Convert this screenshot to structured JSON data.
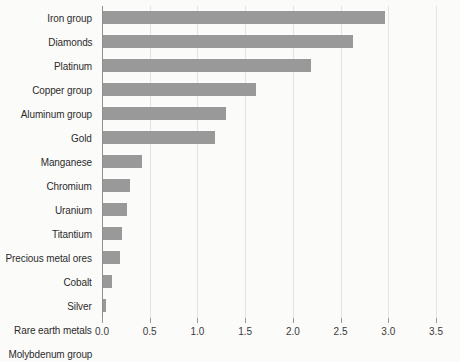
{
  "chart_data": {
    "type": "bar",
    "orientation": "horizontal",
    "title": "",
    "subtitle": "",
    "xlabel": "",
    "ylabel": "",
    "xlim": [
      0.0,
      3.5
    ],
    "xticks": [
      "0.0",
      "0.5",
      "1.0",
      "1.5",
      "2.0",
      "2.5",
      "3.0",
      "3.5"
    ],
    "xtick_values": [
      0.0,
      0.5,
      1.0,
      1.5,
      2.0,
      2.5,
      3.0,
      3.5
    ],
    "grid": "vertical",
    "legend": "none",
    "bar_color": "#999999",
    "categories": [
      "Iron group",
      "Diamonds",
      "Platinum",
      "Copper group",
      "Aluminum group",
      "Gold",
      "Manganese",
      "Chromium",
      "Uranium",
      "Titantium",
      "Precious metal ores",
      "Cobalt",
      "Silver",
      "Rare earth metals",
      "Molybdenum group"
    ],
    "values": [
      2.96,
      2.62,
      2.18,
      1.6,
      1.29,
      1.17,
      0.41,
      0.28,
      0.25,
      0.2,
      0.18,
      0.09,
      0.03,
      0.0,
      0.0
    ]
  },
  "colors": {
    "background": "#fbfbfa",
    "bar": "#999999",
    "gridline": "#e3e3e1",
    "axis": "#8f8f8f",
    "label_text": "#2b2b2b",
    "tick_text": "#3a3a3a"
  }
}
